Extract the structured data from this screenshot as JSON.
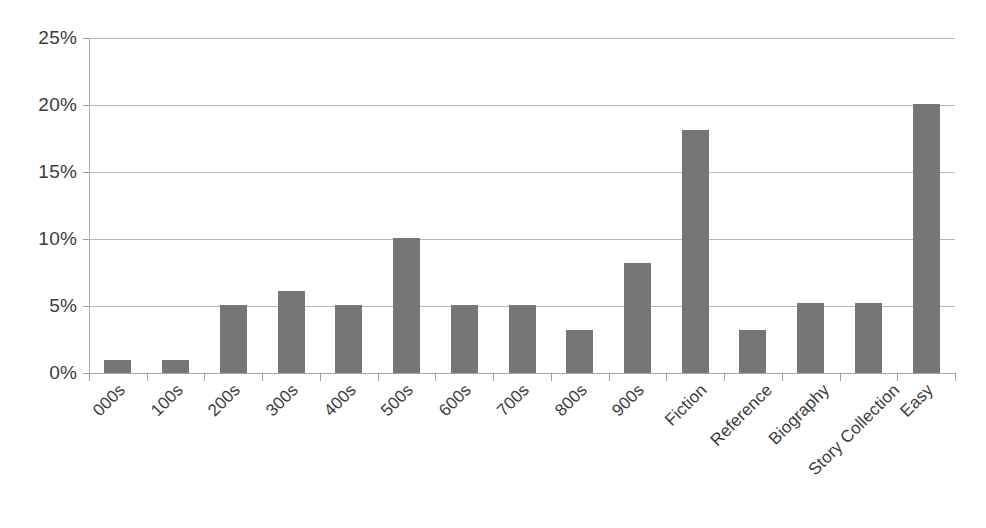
{
  "chart_data": {
    "type": "bar",
    "title": "",
    "subtitle": "",
    "xlabel": "",
    "ylabel": "",
    "categories": [
      "000s",
      "100s",
      "200s",
      "300s",
      "400s",
      "500s",
      "600s",
      "700s",
      "800s",
      "900s",
      "Fiction",
      "Reference",
      "Biography",
      "Story Collection",
      "Easy"
    ],
    "values": [
      1.0,
      1.0,
      5.1,
      6.1,
      5.1,
      10.1,
      5.1,
      5.1,
      3.2,
      8.2,
      18.1,
      3.2,
      5.2,
      5.2,
      20.1
    ],
    "value_labels": [
      "1%",
      "1%",
      "5%",
      "6%",
      "5%",
      "10%",
      "5%",
      "5%",
      "3%",
      "8%",
      "18%",
      "3%",
      "5%",
      "5%",
      "20%"
    ],
    "ylim": [
      0,
      25
    ],
    "y_ticks": [
      0,
      5,
      10,
      15,
      20,
      25
    ],
    "y_tick_labels": [
      "0%",
      "5%",
      "10%",
      "15%",
      "20%",
      "25%"
    ],
    "grid": true,
    "legend": "none",
    "series_name": "Percent of collection",
    "bar_color": "#767676",
    "gridline_color": "#b8b8b8",
    "axis_color": "#b0b0b0",
    "background_color": "#ffffff",
    "x_tick_label_rotation": -45
  }
}
